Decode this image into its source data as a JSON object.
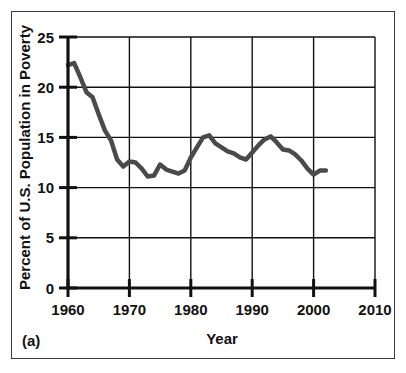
{
  "figure": {
    "panel_label": "(a)",
    "background_color": "#ffffff",
    "frame_color": "#3b3b3b"
  },
  "chart_data": {
    "type": "line",
    "title": "",
    "xlabel": "Year",
    "ylabel": "Percent of U.S. Population in Poverty",
    "xlim": [
      1960,
      2010
    ],
    "ylim": [
      0,
      25
    ],
    "xticks": [
      1960,
      1970,
      1980,
      1990,
      2000,
      2010
    ],
    "xtick_labels": [
      "1960",
      "1970",
      "1980",
      "1990",
      "2000",
      "2010"
    ],
    "yticks": [
      0,
      5,
      10,
      15,
      20,
      25
    ],
    "ytick_labels": [
      "0",
      "5",
      "10",
      "15",
      "20",
      "25"
    ],
    "grid": true,
    "grid_color": "#111111",
    "legend": null,
    "line_color": "#4a4a4a",
    "line_width": 4.5,
    "x": [
      1960,
      1961,
      1962,
      1963,
      1964,
      1965,
      1966,
      1967,
      1968,
      1969,
      1970,
      1971,
      1972,
      1973,
      1974,
      1975,
      1976,
      1977,
      1978,
      1979,
      1980,
      1981,
      1982,
      1983,
      1984,
      1985,
      1986,
      1987,
      1988,
      1989,
      1990,
      1991,
      1992,
      1993,
      1994,
      1995,
      1996,
      1997,
      1998,
      1999,
      2000,
      2001,
      2002
    ],
    "y": [
      22.2,
      22.4,
      21.0,
      19.5,
      19.0,
      17.3,
      15.7,
      14.7,
      12.8,
      12.1,
      12.6,
      12.5,
      11.9,
      11.1,
      11.2,
      12.3,
      11.8,
      11.6,
      11.4,
      11.7,
      13.0,
      14.0,
      15.0,
      15.2,
      14.4,
      14.0,
      13.6,
      13.4,
      13.0,
      12.8,
      13.5,
      14.2,
      14.8,
      15.1,
      14.5,
      13.8,
      13.7,
      13.3,
      12.7,
      11.9,
      11.3,
      11.7,
      11.7
    ]
  }
}
